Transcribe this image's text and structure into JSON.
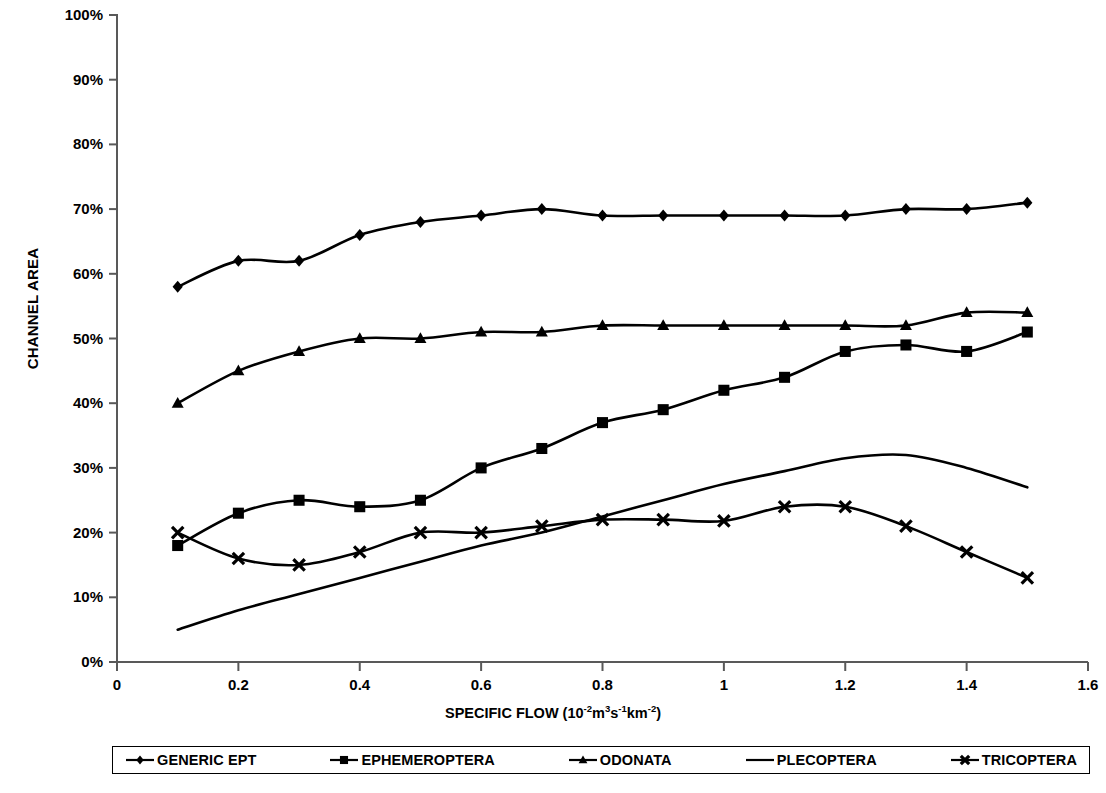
{
  "chart_data": {
    "type": "line",
    "title": "",
    "xlabel": "SPECIFIC FLOW (10-2m3s-1km-2)",
    "xlabel_parts": {
      "main": "SPECIFIC FLOW (10",
      "sup1": "-2",
      "mid1": "m",
      "sup2": "3",
      "mid2": "s",
      "sup3": "-1",
      "mid3": "km",
      "sup4": "-2",
      "tail": ")"
    },
    "ylabel": "CHANNEL AREA",
    "xlim": [
      0,
      1.6
    ],
    "ylim": [
      0,
      100
    ],
    "grid": false,
    "legend_position": "bottom",
    "x_ticks": [
      "0",
      "0.2",
      "0.4",
      "0.6",
      "0.8",
      "1",
      "1.2",
      "1.4",
      "1.6"
    ],
    "x_tick_values": [
      0,
      0.2,
      0.4,
      0.6,
      0.8,
      1.0,
      1.2,
      1.4,
      1.6
    ],
    "y_ticks": [
      "0%",
      "10%",
      "20%",
      "30%",
      "40%",
      "50%",
      "60%",
      "70%",
      "80%",
      "90%",
      "100%"
    ],
    "y_tick_values": [
      0,
      10,
      20,
      30,
      40,
      50,
      60,
      70,
      80,
      90,
      100
    ],
    "x": [
      0.1,
      0.2,
      0.3,
      0.4,
      0.5,
      0.6,
      0.7,
      0.8,
      0.9,
      1.0,
      1.1,
      1.2,
      1.3,
      1.4,
      1.5
    ],
    "series": [
      {
        "name": "GENERIC EPT",
        "marker": "diamond",
        "values": [
          58,
          62,
          62,
          66,
          68,
          69,
          70,
          69,
          69,
          69,
          69,
          69,
          70,
          70,
          71
        ]
      },
      {
        "name": "EPHEMEROPTERA",
        "marker": "square",
        "values": [
          18,
          23,
          25,
          24,
          25,
          30,
          33,
          37,
          39,
          42,
          44,
          48,
          49,
          48,
          51
        ]
      },
      {
        "name": "ODONATA",
        "marker": "triangle",
        "values": [
          40,
          45,
          48,
          50,
          50,
          51,
          51,
          52,
          52,
          52,
          52,
          52,
          52,
          54,
          54
        ]
      },
      {
        "name": "PLECOPTERA",
        "marker": "none",
        "values": [
          5,
          8,
          10.5,
          13,
          15.5,
          18,
          20,
          22.5,
          25,
          27.5,
          29.5,
          31.5,
          32,
          30,
          27
        ]
      },
      {
        "name": "TRICOPTERA",
        "marker": "x",
        "values": [
          20,
          16,
          15,
          17,
          20,
          20,
          21,
          22,
          22,
          21.8,
          24,
          24,
          21,
          17,
          13
        ]
      }
    ]
  },
  "legend": {
    "items": [
      {
        "label": "GENERIC EPT",
        "marker": "diamond"
      },
      {
        "label": "EPHEMEROPTERA",
        "marker": "square"
      },
      {
        "label": "ODONATA",
        "marker": "triangle"
      },
      {
        "label": "PLECOPTERA",
        "marker": "none"
      },
      {
        "label": "TRICOPTERA",
        "marker": "x"
      }
    ]
  },
  "colors": {
    "line": "#000000",
    "axis": "#595959",
    "background": "#ffffff"
  }
}
